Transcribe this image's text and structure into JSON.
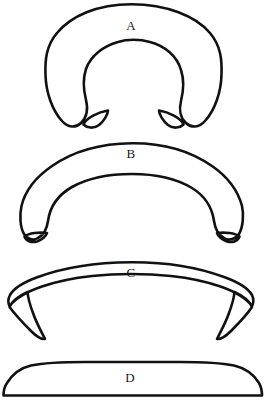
{
  "figure": {
    "background_color": "#ffffff",
    "stroke_color": "#111111",
    "label_color": "#1a1a1a",
    "width": 266,
    "height": 411,
    "shapes": [
      {
        "id": "shape-a",
        "label": "A",
        "description": "thick closed horseshoe / omega ring with a large round opening and two short downward legs ending in pointed tips",
        "label_x": 131,
        "label_y": 27,
        "bounds": {
          "x": 45,
          "y": 4,
          "width": 173,
          "height": 124
        },
        "path": "M 131.5 4.2 C 97 4.2 71 16 57 33 C 46 46 45 60 45.5 75 C 46 92 52 110 62 121 C 68 128 76 128 81 123 C 87 117 88 108 86 100 C 83 88 83 78 86 69 C 91 55 104 46 118 42 C 127 39 140 39 150 42 C 165 46 177 56 181 70 C 184 79 184 89 181 101 C 179 109 180 118 186 123 C 191 128 199 128 205 121 C 215 110 221 92 221.5 75 C 222 60 221 46 210 33 C 196 16 166 4.2 131.5 4.2 Z M 83.5 124.5 C 86 118 98.5 112 108 110.5 C 108 114 104 121 99 125 C 94 129 87 128 83.5 124.5 Z M 183.5 124.5 C 181 118 168.5 112 159 110.5 C 159 114 163 121 168 125 C 173 129 180 128 183.5 124.5 Z"
      },
      {
        "id": "shape-b",
        "label": "B",
        "description": "flattened thick arch with a wide opening, left and right legs ending in small pointed tips",
        "label_x": 131,
        "label_y": 155,
        "bounds": {
          "x": 20,
          "y": 143,
          "width": 225,
          "height": 100
        },
        "path": "M 132 143.2 C 100 143.5 72 152 52 166 C 36 177 25 191 21.5 206 C 19.5 215 20 227 24 234 C 27 239 33 241 38 238 C 44 235 47 228 48 221 C 50 206 58 195 72 187 C 88 178 110 174 132 174 C 155 174 177 179 192 188 C 205 196 212 207 214 221 C 215 228 218 235 224 238 C 229 241 236 239 239 234 C 243 227 244 215 242 206 C 238 191 228 177 212 166 C 192 152 164 143 132 143.2 Z M 24.5 236.5 C 29 233 39 232 47 233 C 46 236 42 240 37 241.5 C 31 243 26 241 24.5 236.5 Z M 239.5 236.5 C 235 233 225 232 217 233 C 218 236 222 240 227 241.5 C 233 243 238 241 239.5 236.5 Z"
      },
      {
        "id": "shape-c",
        "label": "C",
        "description": "shallow wide crescent band curving upward, with sharp pointed tips at both lower ends",
        "label_x": 131,
        "label_y": 274,
        "bounds": {
          "x": 8,
          "y": 262,
          "width": 242,
          "height": 78
        },
        "path": "M 131 262.2 C 96 262.5 62 268 38 277 C 24 282 14 288 10 295 C 8.2 298.5 8 303 9.5 306 C 22 290 56 280 92 276 C 106 274.5 119 274 131 274 C 143 274 157 274.5 171 276 C 207 280 240 290 252 306 C 253.5 303 253.6 298.5 252 295 C 248 288 238 282 224 277 C 200 268 166 262 131 262.2 Z M 9.5 307 C 14 313 23 323 31 331 C 36 336 41 339.5 45 339 C 41 331 36 322 33 313 C 30 305 28 298 27.5 292 C 19 296 12 301 9.5 307 Z M 252 307 C 248 313 239 323 231 331 C 226 336 221 339.5 217 339 C 221 331 226 322 229 313 C 232 305 234 298 234.5 292 C 243 296 250 301 252 307 Z"
      },
      {
        "id": "shape-d",
        "label": "D",
        "description": "long flat slab with a straight bottom edge, slightly domed top and rounded corners",
        "label_x": 130,
        "label_y": 379,
        "bounds": {
          "x": 3,
          "y": 362,
          "width": 259,
          "height": 35
        },
        "path": "M 31 365.5 C 44 362.8 63 362 85 362 L 180 362 C 202 362 221 362.8 234 365.5 C 245 368 254 375 259 383 C 261 386.5 262 391 262 395.5 L 3.5 395.5 C 3.5 391 4.5 386.5 7 383 C 12 375 20 368 31 365.5 Z"
      }
    ]
  }
}
